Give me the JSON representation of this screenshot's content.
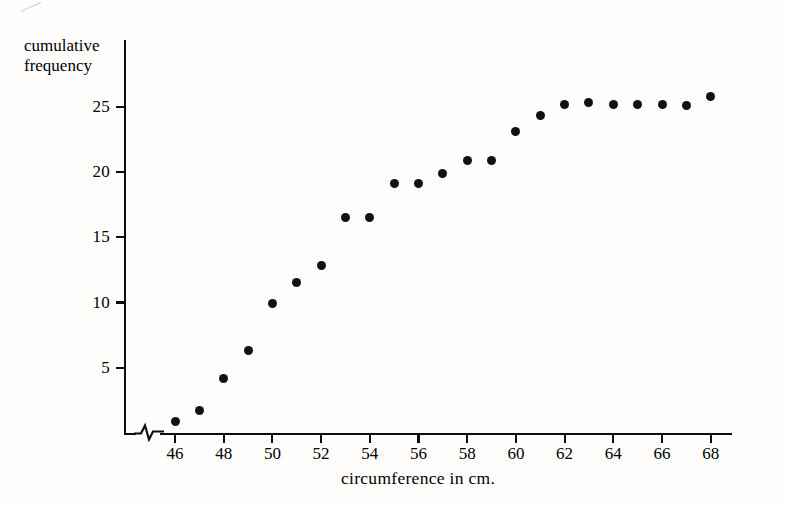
{
  "chart_data": {
    "type": "scatter",
    "title": "",
    "xlabel": "circumference in cm.",
    "ylabel": "cumulative frequency",
    "xlim": [
      45.2,
      69.6
    ],
    "ylim": [
      0,
      27.5
    ],
    "grid": false,
    "legend": null,
    "axis_break_x": true,
    "xticks": [
      46,
      48,
      50,
      52,
      54,
      56,
      58,
      60,
      62,
      64,
      66,
      68
    ],
    "xtick_labels": [
      "46",
      "48",
      "50",
      "52",
      "54",
      "56",
      "58",
      "60",
      "62",
      "64",
      "66",
      "68"
    ],
    "yticks": [
      5,
      10,
      15,
      20,
      25
    ],
    "ytick_labels": [
      "5",
      "10",
      "15",
      "20",
      "25"
    ],
    "x": [
      46,
      47,
      48,
      49,
      50,
      51,
      52,
      53,
      54,
      55,
      56,
      57,
      58,
      59,
      60,
      61,
      62,
      63,
      64,
      65,
      66,
      67,
      68
    ],
    "values": [
      0.9,
      1.7,
      4.2,
      6.3,
      9.9,
      11.5,
      12.8,
      16.5,
      16.5,
      19.1,
      19.1,
      19.9,
      20.9,
      20.9,
      23.1,
      24.3,
      25.2,
      25.3,
      25.2,
      25.2,
      25.2,
      25.1,
      25.8
    ],
    "point_color": "#111111",
    "axis_color": "#0d0d0d"
  },
  "axis_titles": {
    "y_line1": "cumulative",
    "y_line2": "frequency",
    "x": "circumference in cm."
  }
}
